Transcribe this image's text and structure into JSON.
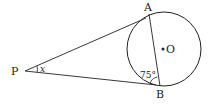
{
  "diagram": {
    "points": {
      "P": "P",
      "A": "A",
      "B": "B",
      "O": "O"
    },
    "angle_x": "x",
    "angle_B": "75°",
    "colors": {
      "stroke": "#222222",
      "background": "#ffffff"
    }
  }
}
